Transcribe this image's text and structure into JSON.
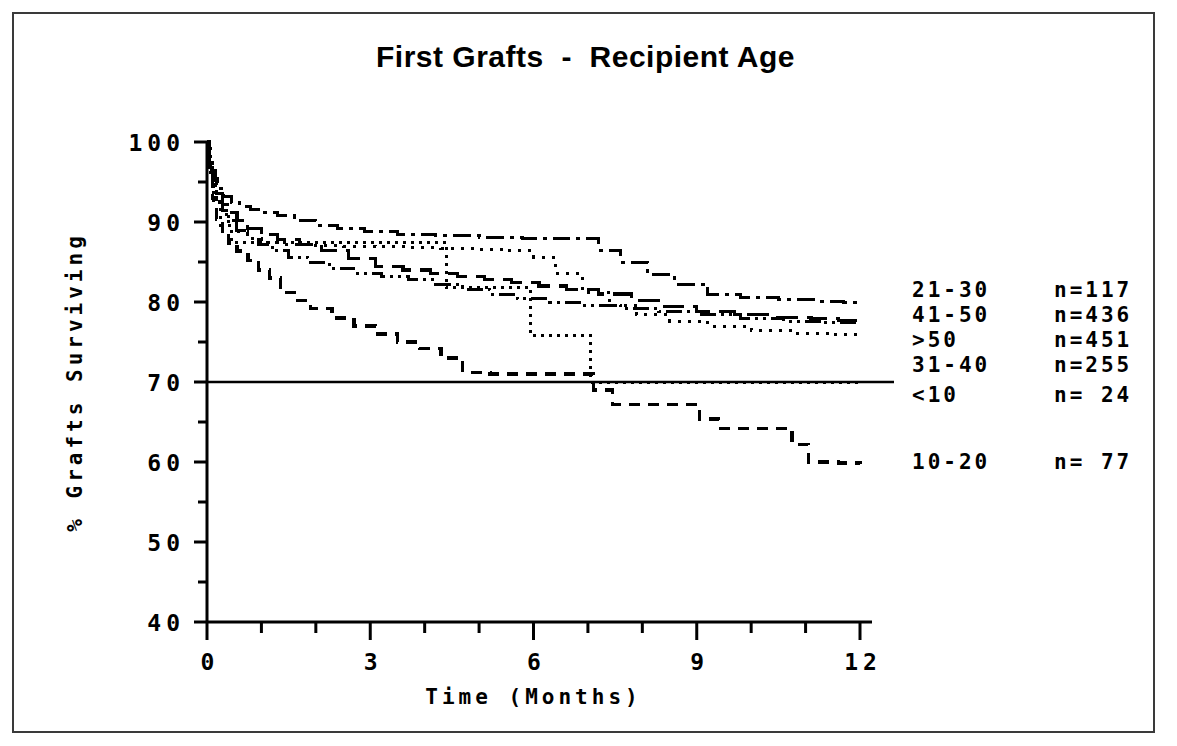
{
  "chart_data": {
    "type": "line",
    "title": "First Grafts  -  Recipient Age",
    "xlabel": "Time  (Months)",
    "ylabel": "% Grafts Surviving",
    "xlim": [
      0,
      12
    ],
    "ylim": [
      40,
      100
    ],
    "xticks": [
      "0",
      "3",
      "6",
      "9",
      "12"
    ],
    "xtick_values": [
      0,
      3,
      6,
      9,
      12
    ],
    "xminor_step": 1,
    "yticks": [
      "100",
      "90",
      "80",
      "70",
      "60",
      "50",
      "40"
    ],
    "ytick_values": [
      100,
      90,
      80,
      70,
      60,
      50,
      40
    ],
    "yminor_step": 5,
    "grid": false,
    "legend_position": "right-inline-at-curve-ends",
    "reference_line": {
      "y": 70,
      "style": "solid",
      "note": "solid line extends full width to legend"
    },
    "series": [
      {
        "name": "21-30",
        "label": "21-30",
        "count_label": "n=117",
        "n": 117,
        "style": "dash-dot",
        "end_value": 79.8,
        "points": [
          [
            0.0,
            100.0
          ],
          [
            0.05,
            98.0
          ],
          [
            0.1,
            96.5
          ],
          [
            0.15,
            95.4
          ],
          [
            0.2,
            94.2
          ],
          [
            0.3,
            93.2
          ],
          [
            0.45,
            92.4
          ],
          [
            0.6,
            92.0
          ],
          [
            0.8,
            91.6
          ],
          [
            1.0,
            91.2
          ],
          [
            1.3,
            90.8
          ],
          [
            1.6,
            90.2
          ],
          [
            2.0,
            89.6
          ],
          [
            2.4,
            89.2
          ],
          [
            2.9,
            88.8
          ],
          [
            3.5,
            88.5
          ],
          [
            4.2,
            88.3
          ],
          [
            5.0,
            88.1
          ],
          [
            5.8,
            88.0
          ],
          [
            6.6,
            87.9
          ],
          [
            7.2,
            86.5
          ],
          [
            7.6,
            85.0
          ],
          [
            8.1,
            83.4
          ],
          [
            8.6,
            82.2
          ],
          [
            9.2,
            81.0
          ],
          [
            9.8,
            80.6
          ],
          [
            10.5,
            80.3
          ],
          [
            11.2,
            80.1
          ],
          [
            11.7,
            80.0
          ],
          [
            12.0,
            79.8
          ]
        ]
      },
      {
        "name": "41-50",
        "label": "41-50",
        "count_label": "n=436",
        "n": 436,
        "style": "long-dash",
        "end_value": 77.6,
        "points": [
          [
            0.0,
            100.0
          ],
          [
            0.05,
            97.2
          ],
          [
            0.1,
            95.2
          ],
          [
            0.18,
            93.6
          ],
          [
            0.28,
            92.2
          ],
          [
            0.4,
            91.2
          ],
          [
            0.55,
            90.2
          ],
          [
            0.75,
            89.2
          ],
          [
            1.0,
            88.4
          ],
          [
            1.3,
            87.8
          ],
          [
            1.7,
            87.2
          ],
          [
            2.1,
            86.4
          ],
          [
            2.6,
            85.4
          ],
          [
            3.1,
            84.4
          ],
          [
            3.6,
            84.0
          ],
          [
            4.1,
            83.6
          ],
          [
            4.6,
            83.2
          ],
          [
            5.1,
            82.8
          ],
          [
            5.6,
            82.4
          ],
          [
            6.1,
            82.0
          ],
          [
            6.6,
            81.6
          ],
          [
            7.2,
            81.0
          ],
          [
            7.8,
            80.2
          ],
          [
            8.4,
            79.4
          ],
          [
            9.0,
            78.8
          ],
          [
            9.7,
            78.4
          ],
          [
            10.4,
            78.1
          ],
          [
            11.1,
            77.9
          ],
          [
            11.6,
            77.7
          ],
          [
            12.0,
            77.6
          ]
        ]
      },
      {
        "name": ">50",
        "label": ">50",
        "count_label": "n=451",
        "n": 451,
        "style": "dash-dot-dot",
        "end_value": 77.2,
        "points": [
          [
            0.0,
            100.0
          ],
          [
            0.05,
            96.8
          ],
          [
            0.1,
            94.6
          ],
          [
            0.18,
            92.8
          ],
          [
            0.28,
            91.4
          ],
          [
            0.4,
            90.2
          ],
          [
            0.55,
            89.0
          ],
          [
            0.75,
            88.0
          ],
          [
            0.95,
            87.2
          ],
          [
            1.2,
            86.4
          ],
          [
            1.5,
            85.6
          ],
          [
            1.85,
            85.0
          ],
          [
            2.25,
            84.2
          ],
          [
            2.7,
            83.6
          ],
          [
            3.2,
            83.2
          ],
          [
            3.7,
            82.8
          ],
          [
            4.2,
            82.2
          ],
          [
            4.7,
            81.6
          ],
          [
            5.2,
            81.0
          ],
          [
            5.7,
            80.4
          ],
          [
            6.3,
            80.0
          ],
          [
            6.9,
            79.6
          ],
          [
            7.6,
            79.2
          ],
          [
            8.3,
            78.8
          ],
          [
            9.0,
            78.4
          ],
          [
            9.8,
            78.0
          ],
          [
            10.6,
            77.6
          ],
          [
            11.3,
            77.4
          ],
          [
            12.0,
            77.2
          ]
        ]
      },
      {
        "name": "31-40",
        "label": "31-40",
        "count_label": "n=255",
        "n": 255,
        "style": "fine-dot",
        "end_value": 75.8,
        "points": [
          [
            0.0,
            100.0
          ],
          [
            0.05,
            96.6
          ],
          [
            0.1,
            94.4
          ],
          [
            0.18,
            92.6
          ],
          [
            0.28,
            91.0
          ],
          [
            0.4,
            89.8
          ],
          [
            0.55,
            88.8
          ],
          [
            0.75,
            88.0
          ],
          [
            1.0,
            87.4
          ],
          [
            1.4,
            87.2
          ],
          [
            1.9,
            87.1
          ],
          [
            2.5,
            87.0
          ],
          [
            3.1,
            86.9
          ],
          [
            3.7,
            86.8
          ],
          [
            4.3,
            86.7
          ],
          [
            4.9,
            86.6
          ],
          [
            5.5,
            86.4
          ],
          [
            6.0,
            85.6
          ],
          [
            6.4,
            83.6
          ],
          [
            6.9,
            81.2
          ],
          [
            7.4,
            79.6
          ],
          [
            7.9,
            78.4
          ],
          [
            8.5,
            77.6
          ],
          [
            9.2,
            77.0
          ],
          [
            10.0,
            76.5
          ],
          [
            10.8,
            76.1
          ],
          [
            11.5,
            75.9
          ],
          [
            12.0,
            75.8
          ]
        ]
      },
      {
        "name": "<10",
        "label": "<10",
        "count_label": "n= 24",
        "n": 24,
        "style": "dotted-step",
        "end_value": 70.0,
        "points": [
          [
            0.0,
            100.0
          ],
          [
            0.06,
            95.8
          ],
          [
            0.12,
            92.4
          ],
          [
            0.25,
            89.6
          ],
          [
            0.45,
            87.5
          ],
          [
            0.7,
            87.5
          ],
          [
            1.2,
            87.5
          ],
          [
            2.0,
            87.5
          ],
          [
            3.0,
            87.5
          ],
          [
            4.0,
            87.5
          ],
          [
            4.4,
            87.5
          ],
          [
            4.4,
            81.8
          ],
          [
            5.0,
            81.8
          ],
          [
            5.5,
            81.8
          ],
          [
            5.95,
            81.8
          ],
          [
            5.95,
            75.8
          ],
          [
            6.4,
            75.8
          ],
          [
            6.8,
            75.8
          ],
          [
            7.05,
            75.8
          ],
          [
            7.05,
            70.0
          ],
          [
            7.5,
            70.0
          ],
          [
            8.5,
            70.0
          ],
          [
            9.5,
            70.0
          ],
          [
            10.5,
            70.0
          ],
          [
            11.5,
            70.0
          ],
          [
            12.0,
            70.0
          ]
        ]
      },
      {
        "name": "10-20",
        "label": "10-20",
        "count_label": "n= 77",
        "n": 77,
        "style": "short-dash",
        "end_value": 59.8,
        "points": [
          [
            0.0,
            100.0
          ],
          [
            0.05,
            96.0
          ],
          [
            0.1,
            93.0
          ],
          [
            0.18,
            90.4
          ],
          [
            0.28,
            88.6
          ],
          [
            0.4,
            87.4
          ],
          [
            0.55,
            86.4
          ],
          [
            0.75,
            85.2
          ],
          [
            0.95,
            84.0
          ],
          [
            1.15,
            83.0
          ],
          [
            1.35,
            81.2
          ],
          [
            1.6,
            80.2
          ],
          [
            1.9,
            79.2
          ],
          [
            2.3,
            78.0
          ],
          [
            2.7,
            77.0
          ],
          [
            3.1,
            76.0
          ],
          [
            3.5,
            75.0
          ],
          [
            3.9,
            74.2
          ],
          [
            4.3,
            73.0
          ],
          [
            4.7,
            71.2
          ],
          [
            5.2,
            71.0
          ],
          [
            5.9,
            71.0
          ],
          [
            6.5,
            71.0
          ],
          [
            6.95,
            71.0
          ],
          [
            7.1,
            69.0
          ],
          [
            7.45,
            67.2
          ],
          [
            8.1,
            67.2
          ],
          [
            8.9,
            67.2
          ],
          [
            9.05,
            65.4
          ],
          [
            9.4,
            64.2
          ],
          [
            10.0,
            64.2
          ],
          [
            10.5,
            64.2
          ],
          [
            10.75,
            62.2
          ],
          [
            11.05,
            60.0
          ],
          [
            11.6,
            59.9
          ],
          [
            12.0,
            59.8
          ]
        ]
      }
    ],
    "legend_rows": [
      {
        "label": "21-30",
        "count_label": "n=117"
      },
      {
        "label": "41-50",
        "count_label": "n=436"
      },
      {
        "label": ">50",
        "count_label": "n=451"
      },
      {
        "label": "31-40",
        "count_label": "n=255"
      },
      {
        "label": "<10",
        "count_label": "n= 24"
      },
      {
        "label": "10-20",
        "count_label": "n= 77"
      }
    ]
  },
  "colors": {
    "ink": "#000000",
    "frame": "#3a3a3a",
    "background": "#ffffff"
  }
}
